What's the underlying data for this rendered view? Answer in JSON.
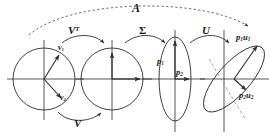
{
  "figure": {
    "type": "diagram",
    "background": "#ffffff",
    "stroke": "#2b2b2b",
    "dashed_stroke": "#8a8a8a"
  },
  "labels": {
    "overall_map": "A",
    "rotation_vt": "V",
    "rotation_vt_sup": "T",
    "scaling": "Σ",
    "rotation_u": "U",
    "rotation_v": "V",
    "right_singular_1": "v",
    "right_singular_1_sub": "1",
    "right_singular_2": "v",
    "right_singular_2_sub": "2",
    "semi_axis_1": "p",
    "semi_axis_1_sub": "1",
    "semi_axis_2": "p",
    "semi_axis_2_sub": "2",
    "out_axis_1": "p",
    "out_axis_1_sub": "1",
    "out_axis_1_u": "u",
    "out_axis_1_u_sub": "1",
    "out_axis_2": "p",
    "out_axis_2_sub": "2",
    "out_axis_2_u": "u",
    "out_axis_2_u_sub": "2"
  },
  "shapes": {
    "stage_1": {
      "name": "unit-circle-with-singular-vectors",
      "cx": 44,
      "cy": 79,
      "r": 31
    },
    "stage_2": {
      "name": "rotated-unit-circle",
      "cx": 112,
      "cy": 79,
      "r": 31
    },
    "stage_3": {
      "name": "scaled-ellipse",
      "cx": 175,
      "cy": 79,
      "rx": 16,
      "ry": 42
    },
    "stage_4": {
      "name": "rotated-ellipse",
      "cx": 235,
      "cy": 79,
      "rx": 42,
      "ry": 17,
      "rotation_deg": -45
    }
  }
}
